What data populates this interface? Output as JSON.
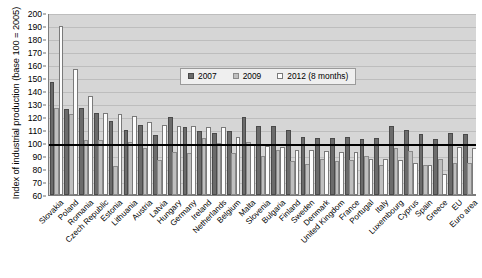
{
  "chart_data": {
    "type": "bar",
    "title": "",
    "xlabel": "",
    "ylabel": "Index of industrial production (base 100 = 2005)",
    "ylim": [
      60,
      200
    ],
    "ytick_step": 10,
    "yticks": [
      60,
      70,
      80,
      90,
      100,
      110,
      120,
      130,
      140,
      150,
      160,
      170,
      180,
      190,
      200
    ],
    "grid": true,
    "legend_position": "top-center",
    "reference_line": 100,
    "categories": [
      "Slovakia",
      "Poland",
      "Romania",
      "Czech Republic",
      "Estonia",
      "Lithuania",
      "Austria",
      "Latvia",
      "Hungary",
      "Germany",
      "Ireland",
      "Netherlands",
      "Belgium",
      "Malta",
      "Slovenia",
      "Bulgaria",
      "Finland",
      "Sweden",
      "Denmark",
      "United Kingdom",
      "France",
      "Portugal",
      "Italy",
      "Luxembourg",
      "Cyprus",
      "Spain",
      "Greece",
      "EU",
      "Euro area"
    ],
    "series": [
      {
        "name": "2007",
        "color": "#6b6b6b",
        "values": [
          147,
          126,
          127,
          123,
          117,
          110,
          114,
          106,
          120,
          112,
          109,
          108,
          109,
          120,
          113,
          113,
          110,
          105,
          104,
          104,
          105,
          103,
          104,
          113,
          110,
          107,
          103,
          108,
          107
        ]
      },
      {
        "name": "2009",
        "color": "#bfbfbf",
        "values": [
          127,
          122,
          102,
          102,
          82,
          101,
          96,
          87,
          93,
          92,
          104,
          100,
          92,
          101,
          90,
          95,
          86,
          84,
          88,
          86,
          87,
          90,
          83,
          96,
          94,
          83,
          88,
          85,
          85
        ]
      },
      {
        "name": "2012 (8 months)",
        "color": "#ffffff",
        "values": [
          190,
          157,
          136,
          123,
          122,
          121,
          116,
          114,
          113,
          113,
          112,
          112,
          105,
          99,
          98,
          97,
          95,
          95,
          94,
          93,
          93,
          88,
          88,
          87,
          85,
          83,
          76,
          97,
          96
        ]
      }
    ]
  },
  "legend": {
    "items": [
      {
        "label": "2007"
      },
      {
        "label": "2009"
      },
      {
        "label": "2012 (8 months)"
      }
    ]
  }
}
